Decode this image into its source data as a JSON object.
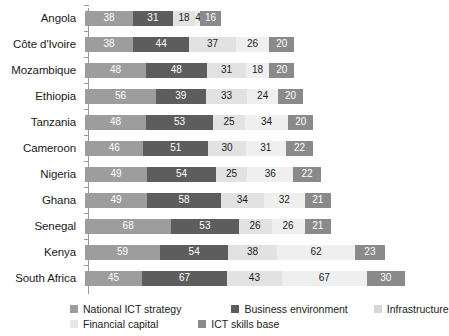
{
  "chart_data": {
    "type": "bar",
    "orientation": "horizontal",
    "stacked": true,
    "title": "",
    "subtitle": "",
    "xlabel": "",
    "ylabel": "",
    "grid": false,
    "legend_position": "bottom",
    "xlim": [
      0,
      260
    ],
    "categories": [
      "Angola",
      "Côte d'Ivoire",
      "Mozambique",
      "Ethiopia",
      "Tanzania",
      "Cameroon",
      "Nigeria",
      "Ghana",
      "Senegal",
      "Kenya",
      "South Africa"
    ],
    "series": [
      {
        "name": "National ICT strategy",
        "color": "#9d9d9d",
        "values": [
          38,
          38,
          48,
          56,
          48,
          46,
          49,
          49,
          68,
          59,
          45
        ]
      },
      {
        "name": "Business environment",
        "color": "#5d5d5d",
        "values": [
          31,
          44,
          48,
          39,
          53,
          51,
          54,
          58,
          53,
          54,
          67
        ]
      },
      {
        "name": "Infrastructure",
        "color": "#d7d7d7",
        "values": [
          18,
          37,
          31,
          33,
          25,
          30,
          25,
          34,
          26,
          38,
          43
        ]
      },
      {
        "name": "Financial capital",
        "color": "#e8e8e8",
        "values": [
          4,
          26,
          18,
          24,
          34,
          31,
          36,
          32,
          26,
          62,
          67
        ]
      },
      {
        "name": "ICT skills base",
        "color": "#8a8a8a",
        "values": [
          16,
          20,
          20,
          20,
          20,
          22,
          22,
          21,
          21,
          23,
          30
        ]
      }
    ],
    "totals": [
      107,
      165,
      165,
      172,
      180,
      180,
      186,
      194,
      194,
      236,
      252
    ]
  },
  "legend": {
    "rows": [
      [
        "National ICT strategy",
        "Business environment",
        "Infrastructure"
      ],
      [
        "Financial capital",
        "ICT skills base"
      ]
    ]
  },
  "icons": {
    "legend_swatch": "square-swatch-icon"
  }
}
